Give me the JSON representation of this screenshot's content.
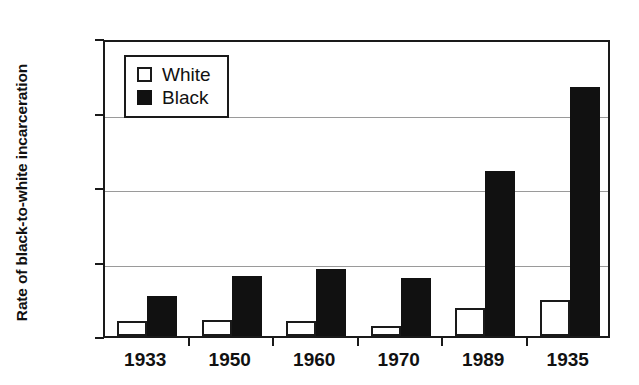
{
  "chart_data": {
    "type": "bar",
    "title": "",
    "xlabel": "",
    "ylabel": "Rate of black-to-white incarceration",
    "categories": [
      "1933",
      "1950",
      "1960",
      "1970",
      "1989",
      "1935"
    ],
    "series": [
      {
        "name": "White",
        "color": "#ffffff",
        "values": [
          0.1,
          0.11,
          0.1,
          0.07,
          0.19,
          0.24
        ]
      },
      {
        "name": "Black",
        "color": "#111111",
        "values": [
          0.27,
          0.4,
          0.45,
          0.39,
          1.11,
          1.67
        ]
      }
    ],
    "ylim": [
      0,
      2
    ],
    "yticks": [
      "0",
      "0.5",
      "1",
      "1.5",
      "2"
    ],
    "ytick_values": [
      0,
      0.5,
      1,
      1.5,
      2
    ],
    "grid": true,
    "grid_axis": "y",
    "legend": {
      "position": "top-left-inside",
      "entries": [
        {
          "label": "White",
          "swatch": "white-square-outline"
        },
        {
          "label": "Black",
          "swatch": "black-filled-square"
        }
      ]
    }
  }
}
